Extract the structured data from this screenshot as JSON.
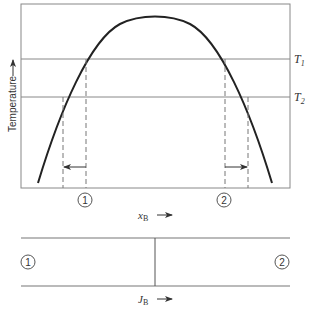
{
  "diagram": {
    "upper_plot": {
      "y_axis_label": "Temperature",
      "x_axis_label_main": "x",
      "x_axis_label_sub": "B",
      "isotherms": [
        {
          "label_main": "T",
          "label_sub": "1"
        },
        {
          "label_main": "T",
          "label_sub": "2"
        }
      ],
      "markers": [
        "1",
        "2"
      ]
    },
    "lower_plot": {
      "x_axis_label_main": "J",
      "x_axis_label_sub": "B",
      "markers": [
        "1",
        "2"
      ]
    },
    "colors": {
      "line": "#777777",
      "curve": "#222222",
      "text": "#333333"
    }
  }
}
